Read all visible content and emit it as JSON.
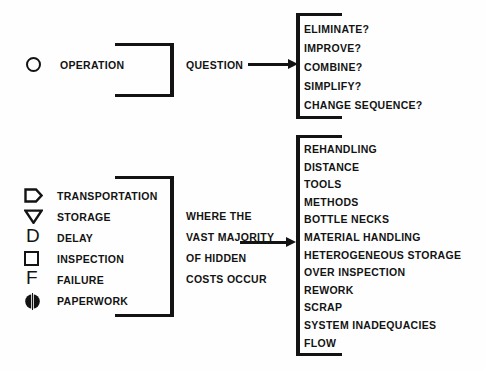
{
  "diagram": {
    "ink_color": "#131313",
    "background_color": "#fefefe"
  },
  "top_row": {
    "symbol_name": "circle-operation-symbol",
    "symbol_label": "OPERATION",
    "connector_label": "QUESTION",
    "questions": [
      "ELIMINATE?",
      "IMPROVE?",
      "COMBINE?",
      "SIMPLIFY?",
      "CHANGE SEQUENCE?"
    ]
  },
  "bottom_row": {
    "legend": [
      {
        "symbol": "transportation-arrow-symbol",
        "label": "TRANSPORTATION",
        "glyph": "pentagon-right"
      },
      {
        "symbol": "storage-triangle-symbol",
        "label": "STORAGE",
        "glyph": "triangle-down"
      },
      {
        "symbol": "delay-d-symbol",
        "label": "DELAY",
        "glyph": "D"
      },
      {
        "symbol": "inspection-square-symbol",
        "label": "INSPECTION",
        "glyph": "square"
      },
      {
        "symbol": "failure-f-symbol",
        "label": "FAILURE",
        "glyph": "F"
      },
      {
        "symbol": "paperwork-circle-symbol",
        "label": "PAPERWORK",
        "glyph": "circle-split"
      }
    ],
    "connector_lines": [
      "WHERE  THE",
      "VAST  MAJORITY",
      "OF  HIDDEN",
      "COSTS  OCCUR"
    ],
    "hidden_costs": [
      "REHANDLING",
      "DISTANCE",
      "TOOLS",
      "METHODS",
      "BOTTLE NECKS",
      "MATERIAL HANDLING",
      "HETEROGENEOUS  STORAGE",
      "OVER INSPECTION",
      "REWORK",
      "SCRAP",
      "SYSTEM INADEQUACIES",
      "FLOW"
    ]
  }
}
